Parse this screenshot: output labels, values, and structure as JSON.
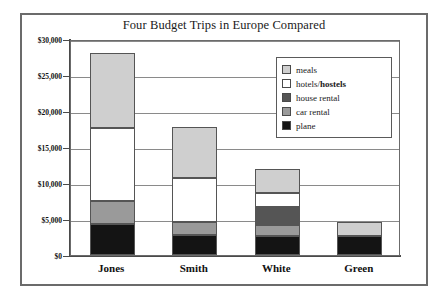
{
  "chart_data": {
    "type": "bar",
    "subtype": "stacked-bar",
    "title": "Four Budget Trips in Europe Compared",
    "xlabel": "",
    "ylabel": "",
    "categories": [
      "Jones",
      "Smith",
      "White",
      "Green"
    ],
    "ylim": [
      0,
      30000
    ],
    "ytick_values": [
      0,
      5000,
      10000,
      15000,
      20000,
      25000,
      30000
    ],
    "ytick_labels": [
      "$0",
      "$5,000",
      "$10,000",
      "$15,000",
      "$20,000",
      "$25,000",
      "$30,000"
    ],
    "grid": true,
    "grid_axis": "y",
    "legend_position": "upper right",
    "legend_order_top_to_bottom": [
      "meals",
      "hotels/hostels",
      "house rental",
      "car rental",
      "plane"
    ],
    "stack_order_bottom_to_top": [
      "plane",
      "car rental",
      "house rental",
      "hotels/hostels",
      "meals"
    ],
    "series": [
      {
        "name": "plane",
        "color": "#141414",
        "values": [
          4300,
          2800,
          2700,
          2700
        ]
      },
      {
        "name": "car rental",
        "color": "#9a9a9a",
        "values": [
          3200,
          1800,
          1400,
          0
        ]
      },
      {
        "name": "house rental",
        "color": "#555555",
        "values": [
          0,
          0,
          2600,
          0
        ]
      },
      {
        "name": "hotels/hostels",
        "color": "#ffffff",
        "values": [
          10200,
          6100,
          1900,
          0
        ]
      },
      {
        "name": "meals",
        "color": "#cfcfcf",
        "values": [
          10300,
          7100,
          3300,
          1900
        ]
      }
    ],
    "totals": [
      28000,
      17800,
      11900,
      4600
    ]
  },
  "legend": {
    "items": [
      {
        "label": "meals",
        "label_plain": "meals",
        "label_bold": "",
        "color": "#cfcfcf"
      },
      {
        "label": "hotels/hostels",
        "label_plain": "hotels/",
        "label_bold": "hostels",
        "color": "#ffffff"
      },
      {
        "label": "house rental",
        "label_plain": "house rental",
        "label_bold": "",
        "color": "#555555"
      },
      {
        "label": "car rental",
        "label_plain": "car rental",
        "label_bold": "",
        "color": "#9a9a9a"
      },
      {
        "label": "plane",
        "label_plain": "plane",
        "label_bold": "",
        "color": "#141414"
      }
    ]
  },
  "colors": {
    "frame": "#6b6b6b",
    "axis": "#4a4a4a",
    "gridline": "#8a8a8a",
    "background": "#ffffff",
    "text": "#111111"
  }
}
